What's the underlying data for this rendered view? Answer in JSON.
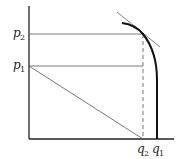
{
  "diagram": {
    "type": "economics-frontier",
    "y_axis_labels": [
      {
        "id": "p2",
        "base": "p",
        "sub": "2"
      },
      {
        "id": "p1",
        "base": "p",
        "sub": "1"
      }
    ],
    "x_axis_labels": [
      {
        "id": "q2",
        "base": "q",
        "sub": "2"
      },
      {
        "id": "q1",
        "base": "q",
        "sub": "1"
      }
    ],
    "elements": [
      "vertical-axis",
      "horizontal-axis",
      "frontier-curve",
      "tangent-line",
      "p2-horizontal-line",
      "p1-horizontal-line",
      "q2-dashed-line",
      "diagonal-line"
    ]
  },
  "colors": {
    "ink": "#222222",
    "thin": "#555555",
    "background": "#ffffff"
  }
}
